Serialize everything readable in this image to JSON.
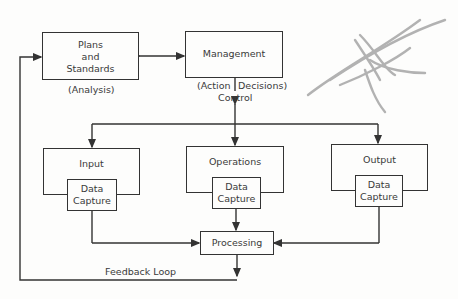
{
  "diagram": {
    "nodes": {
      "plans": {
        "lines": [
          "Plans",
          "and",
          "Standards"
        ],
        "caption": "(Analysis)"
      },
      "management": {
        "label": "Management",
        "caption_left": "(Action",
        "caption_right": "Decisions)"
      },
      "control_label": "Control",
      "input": {
        "label": "Input",
        "sub": [
          "Data",
          "Capture"
        ]
      },
      "operations": {
        "label": "Operations",
        "sub": [
          "Data",
          "Capture"
        ]
      },
      "output": {
        "label": "Output",
        "sub": [
          "Data",
          "Capture"
        ]
      },
      "processing": {
        "label": "Processing"
      }
    },
    "feedback_label": "Feedback Loop",
    "edges": [
      {
        "from": "plans",
        "to": "management",
        "type": "bidirectional"
      },
      {
        "from": "management",
        "to": "input",
        "label": "Control"
      },
      {
        "from": "management",
        "to": "operations",
        "label": "Control"
      },
      {
        "from": "management",
        "to": "output",
        "label": "Control"
      },
      {
        "from": "input",
        "to": "processing"
      },
      {
        "from": "operations",
        "to": "processing"
      },
      {
        "from": "output",
        "to": "processing"
      },
      {
        "from": "processing",
        "to": "plans",
        "label": "Feedback Loop"
      }
    ],
    "colors": {
      "line": "#333333",
      "text": "#3a3a3a",
      "background": "#fdfdfc",
      "scribble": "#9a9a9a"
    }
  }
}
